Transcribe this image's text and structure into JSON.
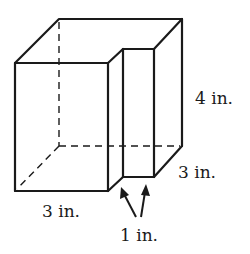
{
  "figure": {
    "labels": {
      "height": "4 in.",
      "depth": "3 in.",
      "width": "3 in.",
      "notch": "1 in."
    }
  }
}
